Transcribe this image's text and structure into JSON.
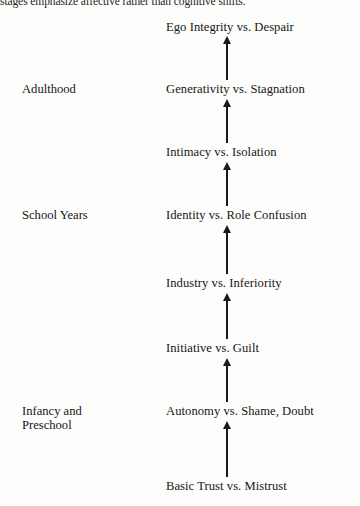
{
  "caption": {
    "text": "stages emphasize affective rather than cognitive shifts."
  },
  "diagram": {
    "arrow_direction": "upward",
    "arrow_count": 7,
    "stages": [
      {
        "label": "Ego Integrity vs. Despair",
        "top": 20
      },
      {
        "label": "Generativity vs. Stagnation",
        "top": 82
      },
      {
        "label": "Intimacy vs. Isolation",
        "top": 145
      },
      {
        "label": "Identity vs. Role Confusion",
        "top": 208
      },
      {
        "label": "Industry vs. Inferiority",
        "top": 276
      },
      {
        "label": "Initiative vs. Guilt",
        "top": 341
      },
      {
        "label": "Autonomy vs. Shame, Doubt",
        "top": 404
      },
      {
        "label": "Basic Trust vs. Mistrust",
        "top": 479
      }
    ],
    "age_groups": [
      {
        "line1": "Adulthood",
        "line2": "",
        "top": 82
      },
      {
        "line1": "School Years",
        "line2": "",
        "top": 208
      },
      {
        "line1": "Infancy and",
        "line2": "Preschool",
        "top": 404
      }
    ],
    "arrows": [
      {
        "top": 36,
        "height": 44
      },
      {
        "top": 99,
        "height": 44
      },
      {
        "top": 162,
        "height": 44
      },
      {
        "top": 225,
        "height": 49
      },
      {
        "top": 293,
        "height": 46
      },
      {
        "top": 358,
        "height": 44
      },
      {
        "top": 421,
        "height": 56
      }
    ],
    "colors": {
      "ink": "#1a1a1a",
      "background": "#fdfdfc"
    }
  }
}
